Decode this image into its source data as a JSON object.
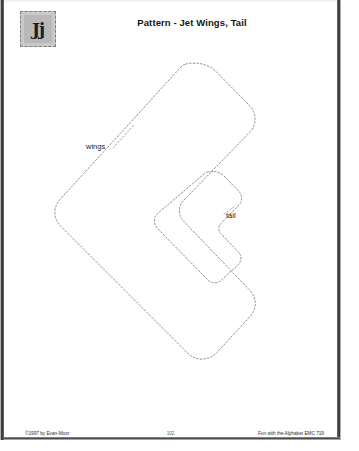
{
  "document": {
    "title": "Pattern - Jet Wings, Tail",
    "letter_tile": {
      "label": "Jj",
      "background_color": "#c9c9c9",
      "border_style": "dashed"
    }
  },
  "pattern": {
    "description": "Cut-out pattern sheet with two dashed cutting outlines",
    "line_style": "dashed",
    "line_color": "#8a8a96",
    "pieces": [
      {
        "name": "wings",
        "label": "wings",
        "shape": "chevron",
        "label_position": {
          "x": 86,
          "y": 142
        }
      },
      {
        "name": "tail",
        "label": "tail",
        "shape": "chevron",
        "label_position": {
          "x": 226,
          "y": 211
        }
      }
    ]
  },
  "footer": {
    "copyright": "©1997 by Evan-Moor",
    "page_number": "102",
    "series": "Fun with the Alphabet EMC 719"
  }
}
